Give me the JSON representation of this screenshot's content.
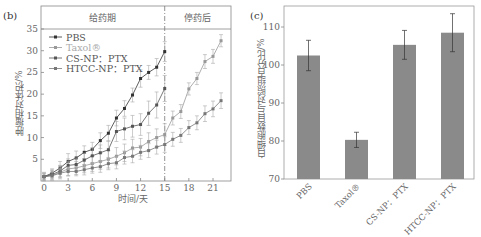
{
  "panels": {
    "left_label": "(b)",
    "right_label": "(c)"
  },
  "chart_data": [
    {
      "type": "line",
      "title": "",
      "xlabel": "时间/天",
      "ylabel": "肿瘤相对体积/%",
      "xlim": [
        0,
        23
      ],
      "ylim": [
        0,
        39
      ],
      "xticks": [
        0,
        3,
        6,
        9,
        12,
        15,
        18,
        21
      ],
      "yticks": [
        5,
        10,
        15,
        20,
        25,
        30,
        35
      ],
      "grid": false,
      "legend_position": "upper left",
      "annotations": [
        {
          "text": "给药期",
          "region": "days 0-15"
        },
        {
          "text": "停药后",
          "region": "days 15-23"
        },
        {
          "type": "vline",
          "x": 15,
          "style": "dash-dot"
        }
      ],
      "series": [
        {
          "name": "PBS",
          "color": "#333333",
          "x": [
            0,
            1,
            2,
            3,
            4,
            5,
            6,
            7,
            8,
            9,
            10,
            11,
            12,
            13,
            14,
            15
          ],
          "values": [
            1,
            1.8,
            3,
            4.5,
            5.3,
            6.6,
            7.3,
            9.3,
            11,
            14.5,
            16.7,
            19.8,
            23.6,
            25,
            26.2,
            29.8
          ],
          "error": [
            0.8,
            1,
            1.5,
            1.8,
            1.6,
            1.5,
            1.6,
            1.8,
            1.8,
            1.8,
            1.8,
            1.6,
            2,
            1.6,
            2,
            2.3
          ]
        },
        {
          "name": "Taxol®",
          "color": "#999999",
          "x": [
            0,
            1,
            2,
            3,
            4,
            5,
            6,
            7,
            8,
            9,
            10,
            11,
            12,
            13,
            14,
            15,
            16,
            17,
            18,
            19,
            20,
            21,
            22
          ],
          "values": [
            1,
            1.3,
            2,
            2.8,
            3,
            3.5,
            4,
            4.5,
            5,
            5.7,
            6.5,
            7.6,
            7.8,
            9.1,
            10,
            10.7,
            14.5,
            16,
            21.2,
            23.6,
            27.5,
            28.7,
            32.3
          ],
          "error": [
            1,
            1.2,
            1.5,
            1.6,
            1.5,
            1.6,
            1.8,
            1.8,
            2,
            2,
            2,
            2,
            2,
            2,
            2,
            2.5,
            1.6,
            1.6,
            1.4,
            1.4,
            1.6,
            1.6,
            1.4
          ]
        },
        {
          "name": "CS-NP：PTX",
          "color": "#555555",
          "x": [
            0,
            1,
            2,
            3,
            4,
            5,
            6,
            7,
            8,
            9,
            10,
            11,
            12,
            13,
            14,
            15
          ],
          "values": [
            1,
            1.5,
            2.3,
            3.6,
            3.8,
            4.8,
            5.8,
            6.5,
            7.2,
            11.4,
            12,
            12.6,
            13,
            15.6,
            17.5,
            21.3
          ],
          "error": [
            0.8,
            1,
            1.3,
            1.5,
            1.5,
            1.6,
            1.8,
            1.8,
            2,
            2.3,
            2.5,
            2.5,
            2.5,
            2.8,
            3,
            3
          ]
        },
        {
          "name": "HTCC-NP：PTX",
          "color": "#777777",
          "x": [
            0,
            1,
            2,
            3,
            4,
            5,
            6,
            7,
            8,
            9,
            10,
            11,
            12,
            13,
            14,
            15,
            16,
            17,
            18,
            19,
            20,
            21,
            22
          ],
          "values": [
            1,
            1.2,
            1.8,
            2.2,
            2.2,
            2.6,
            3,
            3.3,
            4,
            4.2,
            5.4,
            5.7,
            6.6,
            7,
            7.8,
            8.4,
            9.6,
            10.5,
            12.3,
            13.4,
            15.5,
            16.6,
            18.5
          ],
          "error": [
            0.6,
            0.8,
            1,
            1,
            1,
            1.2,
            1.2,
            1.3,
            1.4,
            1.4,
            1.5,
            1.5,
            1.6,
            1.6,
            1.6,
            1.8,
            1.6,
            1.6,
            1.6,
            1.6,
            1.8,
            1.8,
            1.8
          ]
        }
      ]
    },
    {
      "type": "bar",
      "title": "",
      "xlabel": "",
      "ylabel": "白细胞数目与对照组百分比/%",
      "ylim": [
        70,
        115
      ],
      "yticks": [
        70,
        80,
        90,
        100,
        110
      ],
      "categories": [
        "PBS",
        "Taxol®",
        "CS-NP：PTX",
        "HTCC-NP：PTX"
      ],
      "values": [
        102.5,
        80.3,
        105.3,
        108.5
      ],
      "error": [
        4,
        2,
        3.8,
        5
      ],
      "bar_color": "#8a8a8a",
      "grid": false
    }
  ]
}
